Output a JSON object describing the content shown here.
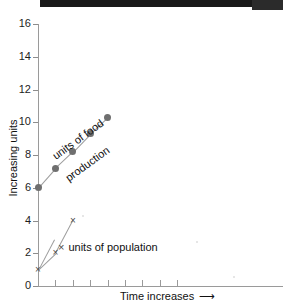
{
  "watermark": {
    "line1": "",
    "line2": ""
  },
  "axes": {
    "y_title": "Increasing units",
    "x_title": "Time increases",
    "x_arrow": "⟶",
    "y_ticks": [
      0,
      2,
      4,
      6,
      8,
      10,
      12,
      14,
      16
    ],
    "x_tick_count": 8
  },
  "legend": {
    "food_line1": "units of food",
    "food_line2": "production",
    "population": "units of population",
    "population_marker": "×"
  },
  "colors": {
    "marker": "#6f6f6f",
    "line": "#9c9c9c",
    "axis": "#9a9a9a",
    "text": "#111111",
    "topbar": "#191919"
  },
  "chart_data": {
    "type": "line",
    "title": "",
    "xlabel": "Time increases",
    "ylabel": "Increasing units",
    "ylim": [
      0,
      16
    ],
    "xlim": [
      0,
      8
    ],
    "grid": false,
    "legend_position": "inline-annotation",
    "series": [
      {
        "name": "units of food production",
        "marker": "circle",
        "x": [
          0,
          1,
          2,
          3,
          4
        ],
        "values": [
          6.0,
          7.2,
          8.2,
          9.3,
          10.3
        ]
      },
      {
        "name": "units of population",
        "marker": "x",
        "x": [
          0,
          1,
          2
        ],
        "values": [
          1.0,
          2.0,
          4.0
        ]
      }
    ]
  }
}
